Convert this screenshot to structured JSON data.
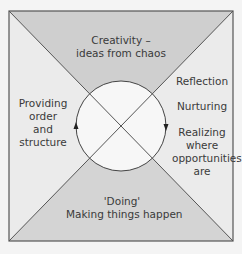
{
  "diagram": {
    "colors": {
      "background": "#f4f4f4",
      "frame": "#555555",
      "shaded_quadrant": "#cfcfcf",
      "light_quadrant": "#ebebeb",
      "circle_fill": "#f7f7f7",
      "text": "#3a3a3a"
    },
    "quadrants": {
      "top": {
        "lines": [
          "Creativity –",
          "ideas from chaos"
        ]
      },
      "left": {
        "lines": [
          "Providing",
          "order",
          "and",
          "structure"
        ]
      },
      "right": {
        "items": [
          {
            "lines": [
              "Reflection"
            ]
          },
          {
            "lines": [
              "Nurturing"
            ]
          },
          {
            "lines": [
              "Realizing",
              "where",
              "opportunities",
              "are"
            ]
          }
        ]
      },
      "bottom": {
        "lines": [
          "'Doing'",
          "Making things happen"
        ]
      }
    },
    "cycle": {
      "left_arrow_direction": "up",
      "right_arrow_direction": "down"
    }
  }
}
